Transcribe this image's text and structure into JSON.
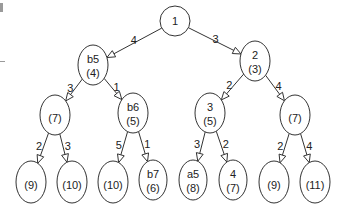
{
  "diagram": {
    "type": "tree",
    "nodes": [
      {
        "id": "n1",
        "label": "1",
        "value": ""
      },
      {
        "id": "n2",
        "label": "b5",
        "value": "(4)"
      },
      {
        "id": "n3",
        "label": "2",
        "value": "(3)"
      },
      {
        "id": "n4",
        "label": "",
        "value": "(7)"
      },
      {
        "id": "n5",
        "label": "b6",
        "value": "(5)"
      },
      {
        "id": "n6",
        "label": "3",
        "value": "(5)"
      },
      {
        "id": "n7",
        "label": "",
        "value": "(7)"
      },
      {
        "id": "n8",
        "label": "",
        "value": "(9)"
      },
      {
        "id": "n9",
        "label": "",
        "value": "(10)"
      },
      {
        "id": "n10",
        "label": "",
        "value": "(10)"
      },
      {
        "id": "n11",
        "label": "b7",
        "value": "(6)"
      },
      {
        "id": "n12",
        "label": "a5",
        "value": "(8)"
      },
      {
        "id": "n13",
        "label": "4",
        "value": "(7)"
      },
      {
        "id": "n14",
        "label": "",
        "value": "(9)"
      },
      {
        "id": "n15",
        "label": "",
        "value": "(11)"
      }
    ],
    "edges": [
      {
        "from": "n1",
        "to": "n2",
        "weight": "4"
      },
      {
        "from": "n1",
        "to": "n3",
        "weight": "3"
      },
      {
        "from": "n2",
        "to": "n4",
        "weight": "3"
      },
      {
        "from": "n2",
        "to": "n5",
        "weight": "1"
      },
      {
        "from": "n3",
        "to": "n6",
        "weight": "2"
      },
      {
        "from": "n3",
        "to": "n7",
        "weight": "4"
      },
      {
        "from": "n4",
        "to": "n8",
        "weight": "2"
      },
      {
        "from": "n4",
        "to": "n9",
        "weight": "3"
      },
      {
        "from": "n5",
        "to": "n10",
        "weight": "5"
      },
      {
        "from": "n5",
        "to": "n11",
        "weight": "1"
      },
      {
        "from": "n6",
        "to": "n12",
        "weight": "3"
      },
      {
        "from": "n6",
        "to": "n13",
        "weight": "2"
      },
      {
        "from": "n7",
        "to": "n14",
        "weight": "2"
      },
      {
        "from": "n7",
        "to": "n15",
        "weight": "4"
      }
    ]
  }
}
